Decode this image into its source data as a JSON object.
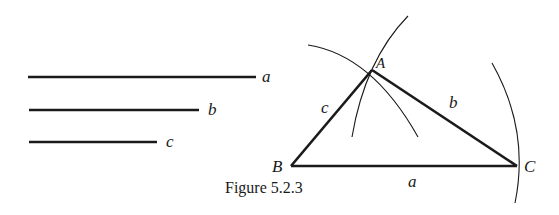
{
  "figure": {
    "caption": "Figure 5.2.3",
    "given_segments": [
      {
        "label": "a",
        "x1": 28,
        "x2": 256,
        "y": 77
      },
      {
        "label": "b",
        "x1": 29,
        "x2": 199,
        "y": 110
      },
      {
        "label": "c",
        "x1": 29,
        "x2": 157,
        "y": 142
      }
    ],
    "triangle": {
      "vertices": {
        "A": {
          "label": "A",
          "x": 372,
          "y": 70
        },
        "B": {
          "label": "B",
          "x": 291,
          "y": 166
        },
        "C": {
          "label": "C",
          "x": 517,
          "y": 166
        }
      },
      "sides": {
        "a": {
          "label": "a"
        },
        "b": {
          "label": "b"
        },
        "c": {
          "label": "c"
        }
      }
    },
    "colors": {
      "ink": "#1a1a1a",
      "background": "#ffffff"
    }
  }
}
